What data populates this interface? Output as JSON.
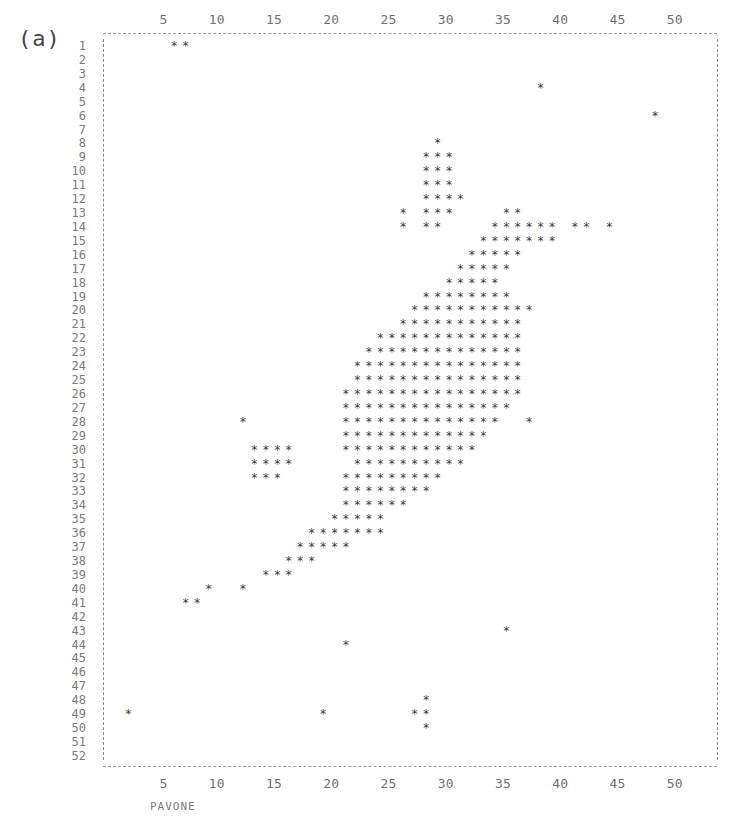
{
  "figure": {
    "panel_label": "(a)",
    "x_axis_label": "PAVONE"
  },
  "chart_data": {
    "type": "scatter",
    "title": "",
    "panel": "(a)",
    "xlabel": "PAVONE",
    "ylabel": "",
    "style": "line-printer character plot (asterisks)",
    "marker": "*",
    "x_ticks": [
      5,
      10,
      15,
      20,
      25,
      30,
      35,
      40,
      45,
      50
    ],
    "x_ticks_top": [
      5,
      10,
      15,
      20,
      25,
      30,
      35,
      40,
      45,
      50
    ],
    "y_ticks": [
      1,
      2,
      3,
      4,
      5,
      6,
      7,
      8,
      9,
      10,
      11,
      12,
      13,
      14,
      15,
      16,
      17,
      18,
      19,
      20,
      21,
      22,
      23,
      24,
      25,
      26,
      27,
      28,
      29,
      30,
      31,
      32,
      33,
      34,
      35,
      36,
      37,
      38,
      39,
      40,
      41,
      42,
      43,
      44,
      45,
      46,
      47,
      48,
      49,
      50,
      51,
      52
    ],
    "xlim": [
      1,
      54
    ],
    "ylim": [
      52,
      1
    ],
    "grid": false,
    "legend": null,
    "rows": [
      {
        "row": 1,
        "cols": [
          6,
          7
        ]
      },
      {
        "row": 4,
        "cols": [
          38
        ]
      },
      {
        "row": 6,
        "cols": [
          48
        ]
      },
      {
        "row": 8,
        "cols": [
          29
        ]
      },
      {
        "row": 9,
        "cols": [
          28,
          29,
          30
        ]
      },
      {
        "row": 10,
        "cols": [
          28,
          29,
          30
        ]
      },
      {
        "row": 11,
        "cols": [
          28,
          29,
          30
        ]
      },
      {
        "row": 12,
        "cols": [
          28,
          29,
          30,
          31
        ]
      },
      {
        "row": 13,
        "cols": [
          26,
          28,
          29,
          30,
          35,
          36
        ]
      },
      {
        "row": 14,
        "cols": [
          26,
          28,
          29,
          34,
          35,
          36,
          37,
          38,
          39,
          41,
          42,
          44
        ]
      },
      {
        "row": 15,
        "cols": [
          33,
          34,
          35,
          36,
          37,
          38,
          39
        ]
      },
      {
        "row": 16,
        "cols": [
          32,
          33,
          34,
          35,
          36
        ]
      },
      {
        "row": 17,
        "cols": [
          31,
          32,
          33,
          34,
          35
        ]
      },
      {
        "row": 18,
        "cols": [
          30,
          31,
          32,
          33,
          34
        ]
      },
      {
        "row": 19,
        "cols": [
          28,
          29,
          30,
          31,
          32,
          33,
          34,
          35
        ]
      },
      {
        "row": 20,
        "cols": [
          27,
          28,
          29,
          30,
          31,
          32,
          33,
          34,
          35,
          36,
          37
        ]
      },
      {
        "row": 21,
        "cols": [
          26,
          27,
          28,
          29,
          30,
          31,
          32,
          33,
          34,
          35,
          36
        ]
      },
      {
        "row": 22,
        "cols": [
          24,
          25,
          26,
          27,
          28,
          29,
          30,
          31,
          32,
          33,
          34,
          35,
          36
        ]
      },
      {
        "row": 23,
        "cols": [
          23,
          24,
          25,
          26,
          27,
          28,
          29,
          30,
          31,
          32,
          33,
          34,
          35,
          36
        ]
      },
      {
        "row": 24,
        "cols": [
          22,
          23,
          24,
          25,
          26,
          27,
          28,
          29,
          30,
          31,
          32,
          33,
          34,
          35,
          36
        ]
      },
      {
        "row": 25,
        "cols": [
          22,
          23,
          24,
          25,
          26,
          27,
          28,
          29,
          30,
          31,
          32,
          33,
          34,
          35,
          36
        ]
      },
      {
        "row": 26,
        "cols": [
          21,
          22,
          23,
          24,
          25,
          26,
          27,
          28,
          29,
          30,
          31,
          32,
          33,
          34,
          35,
          36
        ]
      },
      {
        "row": 27,
        "cols": [
          21,
          22,
          23,
          24,
          25,
          26,
          27,
          28,
          29,
          30,
          31,
          32,
          33,
          34,
          35
        ]
      },
      {
        "row": 28,
        "cols": [
          12,
          21,
          22,
          23,
          24,
          25,
          26,
          27,
          28,
          29,
          30,
          31,
          32,
          33,
          34,
          37
        ]
      },
      {
        "row": 29,
        "cols": [
          21,
          22,
          23,
          24,
          25,
          26,
          27,
          28,
          29,
          30,
          31,
          32,
          33
        ]
      },
      {
        "row": 30,
        "cols": [
          13,
          14,
          15,
          16,
          21,
          22,
          23,
          24,
          25,
          26,
          27,
          28,
          29,
          30,
          31,
          32
        ]
      },
      {
        "row": 31,
        "cols": [
          13,
          14,
          15,
          16,
          22,
          23,
          24,
          25,
          26,
          27,
          28,
          29,
          30,
          31
        ]
      },
      {
        "row": 32,
        "cols": [
          13,
          14,
          15,
          21,
          22,
          23,
          24,
          25,
          26,
          27,
          28,
          29
        ]
      },
      {
        "row": 33,
        "cols": [
          21,
          22,
          23,
          24,
          25,
          26,
          27,
          28
        ]
      },
      {
        "row": 34,
        "cols": [
          21,
          22,
          23,
          24,
          25,
          26
        ]
      },
      {
        "row": 35,
        "cols": [
          20,
          21,
          22,
          23,
          24
        ]
      },
      {
        "row": 36,
        "cols": [
          18,
          19,
          20,
          21,
          22,
          23,
          24
        ]
      },
      {
        "row": 37,
        "cols": [
          17,
          18,
          19,
          20,
          21
        ]
      },
      {
        "row": 38,
        "cols": [
          16,
          17,
          18
        ]
      },
      {
        "row": 39,
        "cols": [
          14,
          15,
          16
        ]
      },
      {
        "row": 40,
        "cols": [
          9,
          12
        ]
      },
      {
        "row": 41,
        "cols": [
          7,
          8
        ]
      },
      {
        "row": 43,
        "cols": [
          35
        ]
      },
      {
        "row": 44,
        "cols": [
          21
        ]
      },
      {
        "row": 48,
        "cols": [
          28
        ]
      },
      {
        "row": 49,
        "cols": [
          2,
          19,
          27,
          28
        ]
      },
      {
        "row": 50,
        "cols": [
          28
        ]
      }
    ]
  },
  "layout": {
    "x0": 105,
    "dx": 11.45,
    "y0": 46,
    "dy": 13.92,
    "frame": {
      "left": 103,
      "right": 717,
      "top": 33,
      "bottom": 766
    },
    "top_tick_y": 12,
    "bottom_tick_y": 776,
    "ink_color": "#3a3a3a"
  }
}
